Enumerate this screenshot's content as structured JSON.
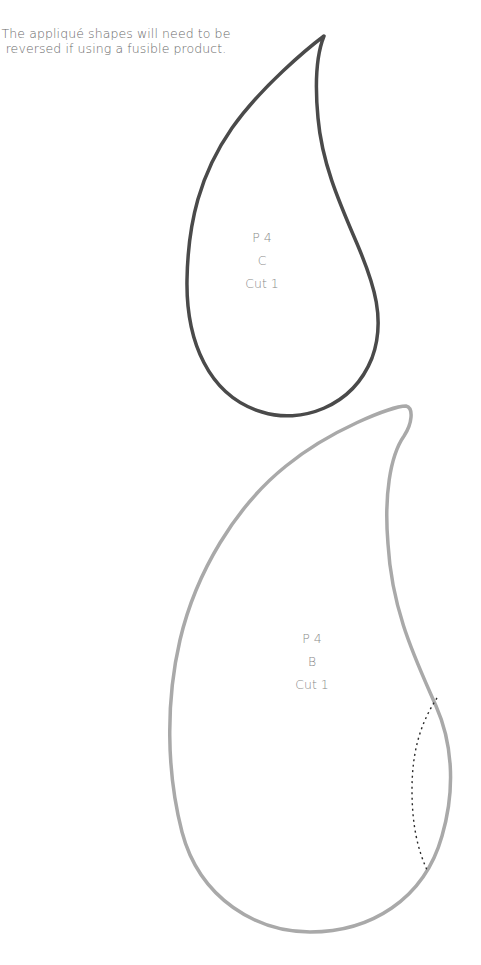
{
  "note": {
    "line1": "The appliqué shapes will need to be",
    "line2": "reversed if using a fusible product."
  },
  "pieces": [
    {
      "id": "C",
      "lines": [
        "P 4",
        "C",
        "Cut 1"
      ],
      "outline_color": "#4a4a4a"
    },
    {
      "id": "B",
      "lines": [
        "P 4",
        "B",
        "Cut 1"
      ],
      "outline_color": "#a9a9a9",
      "has_dotted_placement_line": true
    }
  ]
}
